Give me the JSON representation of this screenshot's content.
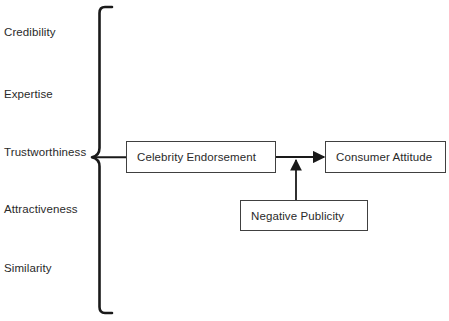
{
  "diagram": {
    "colors": {
      "stroke": "#404040",
      "brace": "#1a1a1a",
      "text": "#2a2a2a",
      "background": "#ffffff"
    },
    "antecedents": {
      "grouping": "brace",
      "items": [
        {
          "label": "Credibility"
        },
        {
          "label": "Expertise"
        },
        {
          "label": "Trustworthiness"
        },
        {
          "label": "Attractiveness"
        },
        {
          "label": "Similarity"
        }
      ]
    },
    "nodes": [
      {
        "id": "celebrity-endorsement",
        "label": "Celebrity Endorsement"
      },
      {
        "id": "consumer-attitude",
        "label": "Consumer Attitude"
      },
      {
        "id": "negative-publicity",
        "label": "Negative Publicity"
      }
    ],
    "connectors": [
      {
        "id": "brace-to-celebrity-endorsement",
        "from": "antecedents-brace",
        "to": "celebrity-endorsement",
        "arrowhead": false
      },
      {
        "id": "celebrity-endorsement-to-consumer-attitude",
        "from": "celebrity-endorsement",
        "to": "consumer-attitude",
        "arrowhead": true
      },
      {
        "id": "negative-publicity-to-link",
        "from": "negative-publicity",
        "to": "celebrity-endorsement-to-consumer-attitude",
        "arrowhead": true
      }
    ]
  }
}
